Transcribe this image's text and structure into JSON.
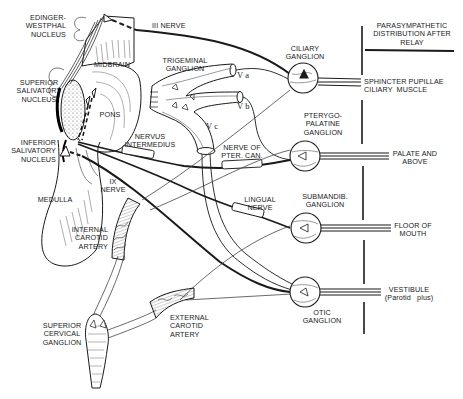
{
  "diagram": {
    "kind": "anatomical pathway diagram",
    "header": {
      "distribution_title": "PARASYMPATHETIC\nDISTRIBUTION AFTER\nRELAY"
    },
    "nuclei": [
      {
        "id": "edinger",
        "label": "EDINGER-\nWESTPHAL\nNUCLEUS"
      },
      {
        "id": "sup_saliv",
        "label": "SUPERIOR\nSALIVATORY\nNUCLEUS"
      },
      {
        "id": "inf_saliv",
        "label": "INFERIOR\nSALIVATORY\nNUCLEUS"
      }
    ],
    "brainstem": {
      "midbrain": "MIDBRAIN",
      "pons": "PONS",
      "medulla": "MEDULLA"
    },
    "nerves": {
      "iii": "III NERVE",
      "nervus_intermedius": "NERVUS\nINTERMEDIUS",
      "ix": "IX\nNERVE",
      "pter_can": "NERVE OF\nPTER. CAN.",
      "lingual": "LINGUAL\nNERVE"
    },
    "trigeminal": {
      "label": "TRIGEMINAL\nGANGLION",
      "va": "V a",
      "vb": "V b",
      "vc": "V c"
    },
    "ganglia": [
      {
        "id": "ciliary",
        "label": "CILIARY\nGANGLION",
        "target": "SPHINCTER PUPILLAE\nCILIARY  MUSCLE"
      },
      {
        "id": "pterygo",
        "label": "PTERYGO-\nPALATINE\nGANGLION",
        "target": "PALATE AND\nABOVE"
      },
      {
        "id": "submandib",
        "label": "SUBMANDIB.\nGANGLION",
        "target": "FLOOR OF\nMOUTH"
      },
      {
        "id": "otic",
        "label": "OTIC\nGANGLION",
        "target": "VESTIBULE\n(Parotid   plus)"
      }
    ],
    "arteries": {
      "internal_carotid": "INTERNAL\nCAROTID\nARTERY",
      "external_carotid": "EXTERNAL\nCAROTID\nARTERY"
    },
    "cervical": {
      "label": "SUPERIOR\nCERVICAL\nGANGLION"
    },
    "colors": {
      "ink": "#1a1a1a",
      "paper": "#ffffff",
      "shade": "#777777"
    }
  }
}
